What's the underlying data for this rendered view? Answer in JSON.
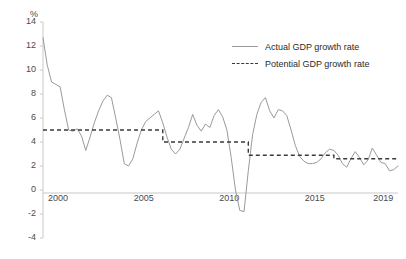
{
  "chart_data": {
    "type": "line",
    "title": "",
    "subtitle": "",
    "xlabel": "",
    "ylabel": "%",
    "unit": "%",
    "grid": false,
    "legend_position": "top-right",
    "xlim": [
      1999.0,
      2019.75
    ],
    "ylim": [
      -4,
      14
    ],
    "ytick_labels": [
      "14",
      "12",
      "10",
      "8",
      "6",
      "4",
      "2",
      "0",
      "-2",
      "-4"
    ],
    "ytick_values": [
      14,
      12,
      10,
      8,
      6,
      4,
      2,
      0,
      -2,
      -4
    ],
    "xtick_labels": [
      "2000",
      "2005",
      "2010",
      "2015",
      "2019"
    ],
    "xtick_values": [
      2000,
      2005,
      2010,
      2015,
      2019
    ],
    "series": [
      {
        "name": "Actual GDP growth rate",
        "style": "solid",
        "color": "#9a9a9a",
        "x": [
          1999.0,
          1999.25,
          1999.5,
          1999.75,
          2000.0,
          2000.25,
          2000.5,
          2000.75,
          2001.0,
          2001.25,
          2001.5,
          2001.75,
          2002.0,
          2002.25,
          2002.5,
          2002.75,
          2003.0,
          2003.25,
          2003.5,
          2003.75,
          2004.0,
          2004.25,
          2004.5,
          2004.75,
          2005.0,
          2005.25,
          2005.5,
          2005.75,
          2006.0,
          2006.25,
          2006.5,
          2006.75,
          2007.0,
          2007.25,
          2007.5,
          2007.75,
          2008.0,
          2008.25,
          2008.5,
          2008.75,
          2009.0,
          2009.25,
          2009.5,
          2009.75,
          2010.0,
          2010.25,
          2010.5,
          2010.75,
          2011.0,
          2011.25,
          2011.5,
          2011.75,
          2012.0,
          2012.25,
          2012.5,
          2012.75,
          2013.0,
          2013.25,
          2013.5,
          2013.75,
          2014.0,
          2014.25,
          2014.5,
          2014.75,
          2015.0,
          2015.25,
          2015.5,
          2015.75,
          2016.0,
          2016.25,
          2016.5,
          2016.75,
          2017.0,
          2017.25,
          2017.5,
          2017.75,
          2018.0,
          2018.25,
          2018.5,
          2018.75,
          2019.0,
          2019.25,
          2019.5,
          2019.75
        ],
        "values": [
          12.7,
          10.4,
          9.0,
          8.8,
          8.6,
          6.7,
          5.0,
          4.9,
          5.1,
          4.5,
          3.3,
          4.4,
          5.6,
          6.6,
          7.4,
          7.9,
          7.7,
          6.0,
          4.2,
          2.2,
          2.0,
          2.6,
          3.9,
          5.0,
          5.7,
          6.0,
          6.3,
          6.6,
          5.6,
          4.4,
          3.4,
          3.0,
          3.4,
          4.3,
          5.2,
          6.3,
          5.4,
          4.9,
          5.5,
          5.2,
          6.2,
          6.7,
          6.1,
          5.0,
          2.7,
          0.0,
          -1.7,
          -1.8,
          1.6,
          4.6,
          6.3,
          7.3,
          7.7,
          6.6,
          6.0,
          6.7,
          6.6,
          6.2,
          5.0,
          3.7,
          2.8,
          2.4,
          2.2,
          2.2,
          2.3,
          2.6,
          3.1,
          3.4,
          3.3,
          2.9,
          2.2,
          1.9,
          2.6,
          3.2,
          2.7,
          2.1,
          2.5,
          3.5,
          2.9,
          2.3,
          2.2,
          1.6,
          1.7,
          2.0
        ]
      },
      {
        "name": "Potential GDP growth rate",
        "style": "dashed",
        "color": "#3a3a3a",
        "steps": [
          {
            "from": 1999.0,
            "to": 2006.0,
            "value": 5.0
          },
          {
            "from": 2006.0,
            "to": 2011.0,
            "value": 4.0
          },
          {
            "from": 2011.0,
            "to": 2016.0,
            "value": 2.9
          },
          {
            "from": 2016.0,
            "to": 2019.75,
            "value": 2.6
          }
        ]
      }
    ],
    "annotations": []
  },
  "legend": {
    "items": [
      {
        "label": "Actual GDP growth rate",
        "style": "solid"
      },
      {
        "label": "Potential GDP growth rate",
        "style": "dashed"
      }
    ]
  }
}
